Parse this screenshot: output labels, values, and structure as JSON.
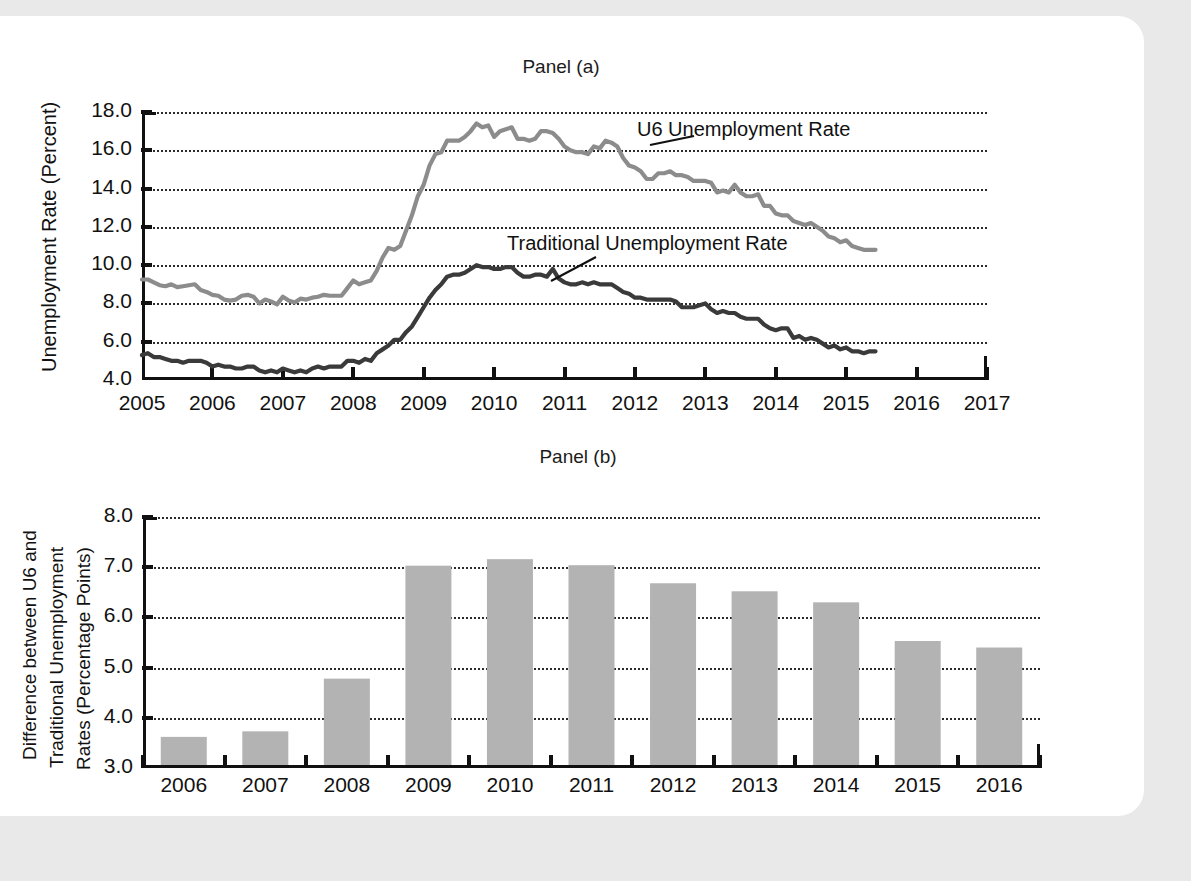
{
  "figure": {
    "background_color": "#e9e9ea",
    "sheet_color": "#ffffff"
  },
  "panel_a": {
    "title": "Panel (a)",
    "y_axis_title": "Unemployment Rate (Percent)",
    "y_ticks": [
      "4.0",
      "6.0",
      "8.0",
      "10.0",
      "12.0",
      "14.0",
      "16.0",
      "18.0"
    ],
    "x_ticks": [
      "2005",
      "2006",
      "2007",
      "2008",
      "2009",
      "2010",
      "2011",
      "2012",
      "2013",
      "2014",
      "2015",
      "2016",
      "2017"
    ],
    "annotation_u6": "U6 Unemployment Rate",
    "annotation_traditional": "Traditional Unemployment Rate",
    "color_u6": "#8c8c8c",
    "color_traditional": "#3a3a3a"
  },
  "panel_b": {
    "title": "Panel (b)",
    "y_axis_title_line1": "Difference between U6 and",
    "y_axis_title_line2": "Traditional Unemployment",
    "y_axis_title_line3": "Rates (Percentage Points)",
    "y_ticks": [
      "3.0",
      "4.0",
      "5.0",
      "6.0",
      "7.0",
      "8.0"
    ],
    "bar_color": "#b3b3b3"
  },
  "chart_data": [
    {
      "type": "line",
      "title": "Panel (a)",
      "xlabel": "",
      "ylabel": "Unemployment Rate (Percent)",
      "xlim": [
        2005,
        2017
      ],
      "ylim": [
        4.0,
        18.0
      ],
      "ytick_step": 2.0,
      "xtick_step": 1,
      "grid": true,
      "legend_position": "inline-annotation",
      "series": [
        {
          "name": "U6 Unemployment Rate",
          "color": "#8c8c8c",
          "x": [
            2005.0,
            2005.083,
            2005.167,
            2005.25,
            2005.333,
            2005.417,
            2005.5,
            2005.583,
            2005.667,
            2005.75,
            2005.833,
            2005.917,
            2006.0,
            2006.083,
            2006.167,
            2006.25,
            2006.333,
            2006.417,
            2006.5,
            2006.583,
            2006.667,
            2006.75,
            2006.833,
            2006.917,
            2007.0,
            2007.083,
            2007.167,
            2007.25,
            2007.333,
            2007.417,
            2007.5,
            2007.583,
            2007.667,
            2007.75,
            2007.833,
            2007.917,
            2008.0,
            2008.083,
            2008.167,
            2008.25,
            2008.333,
            2008.417,
            2008.5,
            2008.583,
            2008.667,
            2008.75,
            2008.833,
            2008.917,
            2009.0,
            2009.083,
            2009.167,
            2009.25,
            2009.333,
            2009.417,
            2009.5,
            2009.583,
            2009.667,
            2009.75,
            2009.833,
            2009.917,
            2010.0,
            2010.083,
            2010.167,
            2010.25,
            2010.333,
            2010.417,
            2010.5,
            2010.583,
            2010.667,
            2010.75,
            2010.833,
            2010.917,
            2011.0,
            2011.083,
            2011.167,
            2011.25,
            2011.333,
            2011.417,
            2011.5,
            2011.583,
            2011.667,
            2011.75,
            2011.833,
            2011.917,
            2012.0,
            2012.083,
            2012.167,
            2012.25,
            2012.333,
            2012.417,
            2012.5,
            2012.583,
            2012.667,
            2012.75,
            2012.833,
            2012.917,
            2013.0,
            2013.083,
            2013.167,
            2013.25,
            2013.333,
            2013.417,
            2013.5,
            2013.583,
            2013.667,
            2013.75,
            2013.833,
            2013.917,
            2014.0,
            2014.083,
            2014.167,
            2014.25,
            2014.333,
            2014.417,
            2014.5,
            2014.583,
            2014.667,
            2014.75,
            2014.833,
            2014.917,
            2015.0,
            2015.083,
            2015.167,
            2015.25,
            2015.333,
            2015.417
          ],
          "y": [
            9.25,
            9.25,
            9.1,
            8.95,
            8.9,
            9.0,
            8.85,
            8.9,
            8.95,
            9.0,
            8.7,
            8.6,
            8.45,
            8.4,
            8.2,
            8.15,
            8.2,
            8.4,
            8.45,
            8.35,
            8.0,
            8.2,
            8.1,
            7.95,
            8.35,
            8.15,
            8.05,
            8.25,
            8.2,
            8.3,
            8.35,
            8.45,
            8.4,
            8.4,
            8.4,
            8.8,
            9.2,
            9.0,
            9.1,
            9.2,
            9.7,
            10.4,
            10.9,
            10.8,
            11.0,
            11.8,
            12.6,
            13.6,
            14.2,
            15.2,
            15.8,
            15.9,
            16.5,
            16.5,
            16.5,
            16.7,
            17.0,
            17.4,
            17.2,
            17.3,
            16.7,
            17.0,
            17.1,
            17.2,
            16.6,
            16.6,
            16.5,
            16.6,
            17.0,
            17.0,
            16.9,
            16.6,
            16.2,
            16.0,
            15.9,
            15.9,
            15.8,
            16.2,
            16.1,
            16.5,
            16.4,
            16.2,
            15.6,
            15.2,
            15.1,
            14.9,
            14.5,
            14.5,
            14.8,
            14.8,
            14.9,
            14.7,
            14.7,
            14.6,
            14.4,
            14.4,
            14.4,
            14.3,
            13.8,
            13.9,
            13.8,
            14.2,
            13.8,
            13.6,
            13.6,
            13.7,
            13.1,
            13.1,
            12.7,
            12.6,
            12.6,
            12.3,
            12.2,
            12.1,
            12.2,
            12.0,
            11.8,
            11.5,
            11.4,
            11.2,
            11.3,
            11.0,
            10.9,
            10.8,
            10.8,
            10.8
          ]
        },
        {
          "name": "Traditional Unemployment Rate",
          "color": "#3a3a3a",
          "x": [
            2005.0,
            2005.083,
            2005.167,
            2005.25,
            2005.333,
            2005.417,
            2005.5,
            2005.583,
            2005.667,
            2005.75,
            2005.833,
            2005.917,
            2006.0,
            2006.083,
            2006.167,
            2006.25,
            2006.333,
            2006.417,
            2006.5,
            2006.583,
            2006.667,
            2006.75,
            2006.833,
            2006.917,
            2007.0,
            2007.083,
            2007.167,
            2007.25,
            2007.333,
            2007.417,
            2007.5,
            2007.583,
            2007.667,
            2007.75,
            2007.833,
            2007.917,
            2008.0,
            2008.083,
            2008.167,
            2008.25,
            2008.333,
            2008.417,
            2008.5,
            2008.583,
            2008.667,
            2008.75,
            2008.833,
            2008.917,
            2009.0,
            2009.083,
            2009.167,
            2009.25,
            2009.333,
            2009.417,
            2009.5,
            2009.583,
            2009.667,
            2009.75,
            2009.833,
            2009.917,
            2010.0,
            2010.083,
            2010.167,
            2010.25,
            2010.333,
            2010.417,
            2010.5,
            2010.583,
            2010.667,
            2010.75,
            2010.833,
            2010.917,
            2011.0,
            2011.083,
            2011.167,
            2011.25,
            2011.333,
            2011.417,
            2011.5,
            2011.583,
            2011.667,
            2011.75,
            2011.833,
            2011.917,
            2012.0,
            2012.083,
            2012.167,
            2012.25,
            2012.333,
            2012.417,
            2012.5,
            2012.583,
            2012.667,
            2012.75,
            2012.833,
            2012.917,
            2013.0,
            2013.083,
            2013.167,
            2013.25,
            2013.333,
            2013.417,
            2013.5,
            2013.583,
            2013.667,
            2013.75,
            2013.833,
            2013.917,
            2014.0,
            2014.083,
            2014.167,
            2014.25,
            2014.333,
            2014.417,
            2014.5,
            2014.583,
            2014.667,
            2014.75,
            2014.833,
            2014.917,
            2015.0,
            2015.083,
            2015.167,
            2015.25,
            2015.333,
            2015.417
          ],
          "y": [
            5.3,
            5.4,
            5.2,
            5.2,
            5.1,
            5.0,
            5.0,
            4.9,
            5.0,
            5.0,
            5.0,
            4.9,
            4.7,
            4.8,
            4.7,
            4.7,
            4.6,
            4.6,
            4.7,
            4.7,
            4.5,
            4.4,
            4.5,
            4.4,
            4.6,
            4.5,
            4.4,
            4.5,
            4.4,
            4.6,
            4.7,
            4.6,
            4.7,
            4.7,
            4.7,
            5.0,
            5.0,
            4.9,
            5.1,
            5.0,
            5.4,
            5.6,
            5.8,
            6.1,
            6.1,
            6.5,
            6.8,
            7.3,
            7.8,
            8.3,
            8.7,
            9.0,
            9.4,
            9.5,
            9.5,
            9.6,
            9.8,
            10.0,
            9.9,
            9.9,
            9.8,
            9.8,
            9.9,
            9.9,
            9.6,
            9.4,
            9.4,
            9.5,
            9.5,
            9.4,
            9.8,
            9.3,
            9.1,
            9.0,
            9.0,
            9.1,
            9.0,
            9.1,
            9.0,
            9.0,
            9.0,
            8.8,
            8.6,
            8.5,
            8.3,
            8.3,
            8.2,
            8.2,
            8.2,
            8.2,
            8.2,
            8.1,
            7.8,
            7.8,
            7.8,
            7.9,
            8.0,
            7.7,
            7.5,
            7.6,
            7.5,
            7.5,
            7.3,
            7.2,
            7.2,
            7.2,
            6.9,
            6.7,
            6.6,
            6.7,
            6.7,
            6.2,
            6.3,
            6.1,
            6.2,
            6.1,
            5.9,
            5.7,
            5.8,
            5.6,
            5.7,
            5.5,
            5.5,
            5.4,
            5.5,
            5.5
          ]
        }
      ]
    },
    {
      "type": "bar",
      "title": "Panel (b)",
      "xlabel": "",
      "ylabel": "Difference between U6 and Traditional Unemployment Rates (Percentage Points)",
      "categories": [
        "2006",
        "2007",
        "2008",
        "2009",
        "2010",
        "2011",
        "2012",
        "2013",
        "2014",
        "2015",
        "2016"
      ],
      "values": [
        3.62,
        3.73,
        4.78,
        7.03,
        7.16,
        7.04,
        6.68,
        6.52,
        6.3,
        5.53,
        5.4
      ],
      "ylim": [
        3.0,
        8.0
      ],
      "ytick_step": 1.0,
      "grid": true,
      "bar_color": "#b3b3b3"
    }
  ]
}
